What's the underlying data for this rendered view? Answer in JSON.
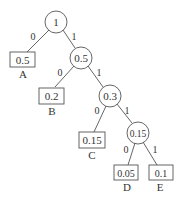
{
  "diagram": {
    "type": "huffman-tree",
    "nodes": {
      "root": {
        "value": "1"
      },
      "n1": {
        "value": "0.5"
      },
      "n2": {
        "value": "0.3"
      },
      "n3": {
        "value": "0.15"
      }
    },
    "leaves": {
      "A": {
        "value": "0.5",
        "label": "A"
      },
      "B": {
        "value": "0.2",
        "label": "B"
      },
      "C": {
        "value": "0.15",
        "label": "C"
      },
      "D": {
        "value": "0.05",
        "label": "D"
      },
      "E": {
        "value": "0.1",
        "label": "E"
      }
    },
    "edge_labels": {
      "root_A": "0",
      "root_n1": "1",
      "n1_B": "0",
      "n1_n2": "1",
      "n2_C": "0",
      "n2_n3": "1",
      "n3_D": "0",
      "n3_E": "1"
    }
  }
}
